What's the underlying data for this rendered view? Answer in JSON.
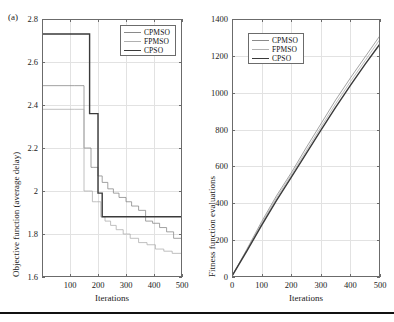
{
  "figure": {
    "panel_label": "(a)",
    "background": "#ffffff",
    "rule_color": "#111111"
  },
  "colors": {
    "cpmso": "#8a8a8a",
    "fpmso": "#b0b0b0",
    "cpso": "#3a3a3a",
    "axis": "#6b6b6b",
    "grid": "#e2e2e2",
    "text": "#222222"
  },
  "legend": {
    "entries": [
      {
        "label": "CPMSO",
        "color": "#8a8a8a",
        "width": 0.9
      },
      {
        "label": "FPMSO",
        "color": "#b0b0b0",
        "width": 0.9
      },
      {
        "label": "CPSO",
        "color": "#3a3a3a",
        "width": 1.5
      }
    ]
  },
  "chart_data": [
    {
      "id": "objective-function-chart",
      "type": "line",
      "title": "",
      "xlabel": "Iterations",
      "ylabel": "Objective function (average delay)",
      "xlim": [
        0,
        500
      ],
      "ylim": [
        1.6,
        2.8
      ],
      "xticks": [
        100,
        200,
        300,
        400,
        500
      ],
      "xticklabels": [
        "100",
        "200",
        "300",
        "400",
        "500"
      ],
      "yticks": [
        1.6,
        1.8,
        2.0,
        2.2,
        2.4,
        2.6,
        2.8
      ],
      "yticklabels": [
        "1.6",
        "1.8",
        "2",
        "2.2",
        "2.4",
        "2.6",
        "2.8"
      ],
      "grid": true,
      "legend_position": "upper-right",
      "drawstyle": "steps-post",
      "series": [
        {
          "name": "CPMSO",
          "color": "#8a8a8a",
          "x": [
            0,
            115,
            150,
            160,
            175,
            185,
            200,
            215,
            235,
            255,
            275,
            300,
            320,
            345,
            370,
            395,
            420,
            445,
            470,
            500
          ],
          "values": [
            2.49,
            2.49,
            2.2,
            2.2,
            2.11,
            2.11,
            2.07,
            2.04,
            2.01,
            1.99,
            1.97,
            1.95,
            1.93,
            1.91,
            1.86,
            1.85,
            1.83,
            1.81,
            1.78,
            1.76
          ]
        },
        {
          "name": "FPMSO",
          "color": "#b0b0b0",
          "x": [
            0,
            115,
            150,
            165,
            180,
            195,
            210,
            225,
            245,
            265,
            290,
            315,
            345,
            375,
            405,
            435,
            465,
            500
          ],
          "values": [
            2.38,
            2.38,
            2.0,
            2.0,
            1.95,
            1.95,
            1.88,
            1.86,
            1.84,
            1.82,
            1.8,
            1.78,
            1.76,
            1.75,
            1.73,
            1.72,
            1.71,
            1.7
          ]
        },
        {
          "name": "CPSO",
          "color": "#3a3a3a",
          "x": [
            0,
            150,
            170,
            185,
            200,
            215,
            500
          ],
          "values": [
            2.73,
            2.73,
            2.36,
            2.36,
            1.99,
            1.88,
            1.85
          ]
        }
      ]
    },
    {
      "id": "fitness-evaluations-chart",
      "type": "line",
      "title": "",
      "xlabel": "Iterations",
      "ylabel": "Fitness function evaluations",
      "xlim": [
        0,
        500
      ],
      "ylim": [
        0,
        1400
      ],
      "xticks": [
        0,
        100,
        200,
        300,
        400,
        500
      ],
      "xticklabels": [
        "0",
        "100",
        "200",
        "300",
        "400",
        "500"
      ],
      "yticks": [
        0,
        200,
        400,
        600,
        800,
        1000,
        1200,
        1400
      ],
      "yticklabels": [
        "0",
        "200",
        "400",
        "600",
        "800",
        "1000",
        "1200",
        "1400"
      ],
      "grid": true,
      "legend_position": "upper-left",
      "drawstyle": "default",
      "series": [
        {
          "name": "CPMSO",
          "color": "#8a8a8a",
          "x": [
            0,
            50,
            100,
            150,
            200,
            250,
            300,
            350,
            400,
            450,
            500
          ],
          "values": [
            5,
            150,
            300,
            440,
            565,
            700,
            830,
            960,
            1080,
            1195,
            1310
          ]
        },
        {
          "name": "FPMSO",
          "color": "#b0b0b0",
          "x": [
            0,
            50,
            100,
            150,
            200,
            250,
            300,
            350,
            400,
            450,
            500
          ],
          "values": [
            5,
            145,
            290,
            428,
            553,
            683,
            812,
            940,
            1060,
            1175,
            1290
          ]
        },
        {
          "name": "CPSO",
          "color": "#3a3a3a",
          "x": [
            0,
            50,
            100,
            150,
            200,
            250,
            300,
            350,
            400,
            450,
            500
          ],
          "values": [
            5,
            140,
            280,
            415,
            540,
            668,
            795,
            920,
            1040,
            1155,
            1265
          ]
        }
      ]
    }
  ]
}
